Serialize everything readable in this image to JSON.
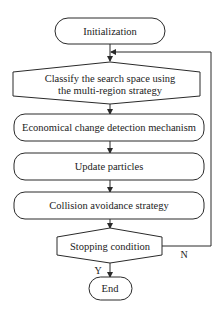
{
  "flowchart": {
    "nodes": [
      {
        "id": "init",
        "shape": "terminator",
        "label": "Initialization"
      },
      {
        "id": "classify",
        "shape": "hexagon",
        "label_line1": "Classify the search space using",
        "label_line2": "the multi-region strategy"
      },
      {
        "id": "detect",
        "shape": "rounded-rect",
        "label": "Economical change detection mechanism"
      },
      {
        "id": "update",
        "shape": "rounded-rect",
        "label": "Update particles"
      },
      {
        "id": "collision",
        "shape": "rounded-rect",
        "label": "Collision avoidance strategy"
      },
      {
        "id": "stop",
        "shape": "hexagon",
        "label": "Stopping condition"
      },
      {
        "id": "end",
        "shape": "terminator",
        "label": "End"
      }
    ],
    "edges": [
      {
        "from": "init",
        "to": "classify",
        "label": ""
      },
      {
        "from": "classify",
        "to": "detect",
        "label": ""
      },
      {
        "from": "detect",
        "to": "update",
        "label": ""
      },
      {
        "from": "update",
        "to": "collision",
        "label": ""
      },
      {
        "from": "collision",
        "to": "stop",
        "label": ""
      },
      {
        "from": "stop",
        "to": "end",
        "label": "Y"
      },
      {
        "from": "stop",
        "to": "classify",
        "label": "N"
      }
    ]
  },
  "colors": {
    "stroke": "#2a2a2a",
    "fill": "#ffffff",
    "background": "#ffffff"
  }
}
